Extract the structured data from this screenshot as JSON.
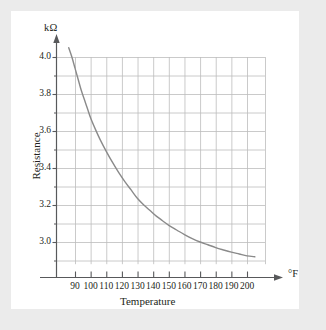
{
  "figure": {
    "background_color": "#ebebeb",
    "card_color": "#ffffff"
  },
  "chart_data": {
    "type": "line",
    "title": "",
    "subtitle": "",
    "xlabel": "Temperature",
    "ylabel": "Resistance",
    "x_unit_label": "°F",
    "y_unit_label": "kΩ",
    "xlim": [
      80,
      207
    ],
    "ylim": [
      2.88,
      4.08
    ],
    "xticks": [
      90,
      100,
      110,
      120,
      130,
      140,
      150,
      160,
      170,
      180,
      190,
      200
    ],
    "xtick_labels": [
      "90",
      "100",
      "110",
      "120",
      "130",
      "140",
      "150",
      "160",
      "170",
      "180",
      "190",
      "200"
    ],
    "yticks": [
      3.0,
      3.2,
      3.4,
      3.6,
      3.8,
      4.0
    ],
    "ytick_labels": [
      "3.0",
      "3.2",
      "3.4",
      "3.6",
      "3.8",
      "4.0"
    ],
    "y_minor_ticks": [
      2.9,
      3.1,
      3.3,
      3.5,
      3.7,
      3.9
    ],
    "grid": true,
    "grid_color": "#bcbcbc",
    "legend": null,
    "legend_position": "none",
    "line_color": "#8a8a8a",
    "line_width": 1.4,
    "series": [
      {
        "name": "Resistance vs Temperature",
        "x": [
          86,
          88,
          90,
          92,
          94,
          96,
          98,
          100,
          103,
          106,
          110,
          114,
          118,
          122,
          126,
          130,
          134,
          138,
          142,
          146,
          150,
          155,
          160,
          165,
          170,
          175,
          180,
          185,
          190,
          195,
          200,
          205
        ],
        "y": [
          4.05,
          4.0,
          3.94,
          3.88,
          3.82,
          3.77,
          3.72,
          3.67,
          3.61,
          3.555,
          3.49,
          3.43,
          3.375,
          3.325,
          3.28,
          3.235,
          3.2,
          3.17,
          3.14,
          3.115,
          3.09,
          3.065,
          3.04,
          3.018,
          3.0,
          2.985,
          2.97,
          2.957,
          2.945,
          2.935,
          2.925,
          2.92
        ]
      }
    ],
    "axis_arrow_x": true,
    "axis_arrow_y": true,
    "axis_color": "#58595b"
  }
}
